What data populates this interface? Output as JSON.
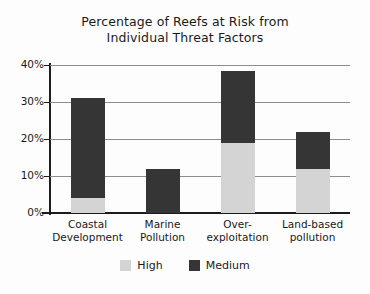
{
  "chart_data": {
    "type": "bar",
    "title": "Percentage of Reefs at Risk from Individual Threat Factors",
    "title_line1": "Percentage of Reefs at Risk from",
    "title_line2": "Individual Threat Factors",
    "xlabel": "",
    "ylabel": "",
    "ylim": [
      0,
      40
    ],
    "yticks": [
      0,
      10,
      20,
      30,
      40
    ],
    "ytick_labels": [
      "0%",
      "10%",
      "20%",
      "30%",
      "40%"
    ],
    "grid": true,
    "stacked": true,
    "legend_position": "bottom-center",
    "categories": [
      "Coastal Development",
      "Marine Pollution",
      "Over-exploitation",
      "Land-based pollution"
    ],
    "category_lines": [
      [
        "Coastal",
        "Development"
      ],
      [
        "Marine",
        "Pollution"
      ],
      [
        "Over-",
        "exploitation"
      ],
      [
        "Land-based",
        "pollution"
      ]
    ],
    "series": [
      {
        "name": "High",
        "color": "#d4d4d4",
        "values": [
          4,
          0,
          19,
          12
        ]
      },
      {
        "name": "Medium",
        "color": "#353535",
        "values": [
          27,
          12,
          19.5,
          10
        ]
      }
    ],
    "totals": [
      31,
      12,
      38.5,
      22
    ]
  },
  "legend": {
    "items": [
      {
        "label": "High",
        "swatch": "high"
      },
      {
        "label": "Medium",
        "swatch": "medium"
      }
    ]
  }
}
